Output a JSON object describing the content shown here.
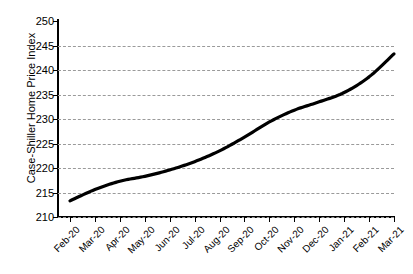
{
  "chart_data": {
    "type": "line",
    "title": "",
    "xlabel": "",
    "ylabel": "Case-Shiller Home Price Index",
    "ylim": [
      210,
      250
    ],
    "ytick_step": 5,
    "yticks": [
      210,
      215,
      220,
      225,
      230,
      235,
      240,
      245,
      250
    ],
    "grid": true,
    "legend": "none",
    "line_color": "#000000",
    "grid_color": "#9a9a9a",
    "axis_color": "#000000",
    "categories": [
      "Feb-20",
      "Mar-20",
      "Apr-20",
      "May-20",
      "Jun-20",
      "Jul-20",
      "Aug-20",
      "Sep-20",
      "Oct-20",
      "Nov-20",
      "Dec-20",
      "Jan-21",
      "Feb-21",
      "Mar-21"
    ],
    "values": [
      213.3,
      215.6,
      217.3,
      218.3,
      219.6,
      221.3,
      223.5,
      226.3,
      229.4,
      231.8,
      233.5,
      235.4,
      238.6,
      243.3
    ],
    "series": [
      {
        "name": "Case-Shiller Home Price Index",
        "values": [
          213.3,
          215.6,
          217.3,
          218.3,
          219.6,
          221.3,
          223.5,
          226.3,
          229.4,
          231.8,
          233.5,
          235.4,
          238.6,
          243.3
        ]
      }
    ]
  }
}
